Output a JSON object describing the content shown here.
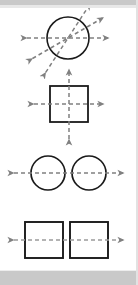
{
  "figure": {
    "background_color": "#ffffff",
    "band_color": "#c9c9c9",
    "shape_stroke_color": "#1a1a1a",
    "axis_color": "#808080",
    "shape_stroke_width": 1.6,
    "axis_stroke_width": 1.5,
    "axis_dash": "4,3",
    "panels": [
      {
        "id": "panel-circle-multi-axis",
        "label": "Circle with multiple lines of symmetry",
        "shape_type": "circle",
        "shape_count": 1,
        "shapes": [
          {
            "cx": 68,
            "cy": 38,
            "r": 21
          }
        ],
        "axis_count": 3,
        "arrow_count": 6,
        "axes": [
          {
            "angle_deg": 0,
            "label": "horizontal-axis"
          },
          {
            "angle_deg": 30,
            "label": "diagonal-axis-30"
          },
          {
            "angle_deg": 57,
            "label": "diagonal-axis-57"
          }
        ],
        "axis_length": 41
      },
      {
        "id": "panel-square-cross-axis",
        "label": "Square with horizontal and vertical lines of symmetry",
        "shape_type": "square",
        "shape_count": 1,
        "shapes": [
          {
            "x": 50,
            "y": 86,
            "w": 38,
            "h": 36
          }
        ],
        "axis_count": 2,
        "arrow_count": 4,
        "axes": [
          {
            "angle_deg": 0,
            "label": "horizontal-axis"
          },
          {
            "angle_deg": 90,
            "label": "vertical-axis"
          }
        ],
        "axis_length": 35
      },
      {
        "id": "panel-two-circles-axis",
        "label": "Two circles with a shared horizontal line of symmetry",
        "shape_type": "circle",
        "shape_count": 2,
        "shapes": [
          {
            "cx": 48,
            "cy": 173,
            "r": 17
          },
          {
            "cx": 89,
            "cy": 173,
            "r": 17
          }
        ],
        "axis_count": 1,
        "arrow_count": 2,
        "axes": [
          {
            "angle_deg": 0,
            "label": "horizontal-axis"
          }
        ],
        "axis_x_start": 12,
        "axis_x_end": 126
      },
      {
        "id": "panel-two-squares-axis",
        "label": "Two squares with a shared horizontal line of symmetry",
        "shape_type": "square",
        "shape_count": 2,
        "shapes": [
          {
            "x": 25,
            "y": 222,
            "w": 38,
            "h": 36
          },
          {
            "x": 70,
            "y": 222,
            "w": 38,
            "h": 36
          }
        ],
        "axis_count": 1,
        "arrow_count": 2,
        "axes": [
          {
            "angle_deg": 0,
            "label": "horizontal-axis"
          }
        ],
        "axis_x_start": 12,
        "axis_x_end": 126
      }
    ]
  }
}
